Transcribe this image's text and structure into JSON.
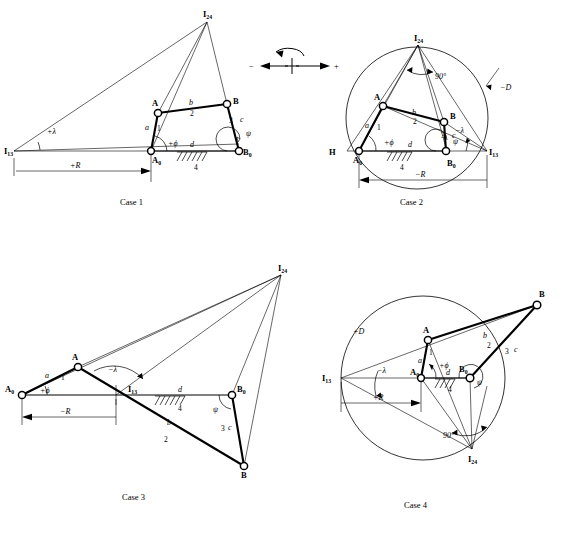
{
  "figure": {
    "sign_legend": {
      "minus_label": "−",
      "plus_center_label": "+",
      "plus_right_label": "+",
      "rotation_icon": "ccw-rotation-arrow"
    }
  },
  "symbols": {
    "A": "A",
    "B": "B",
    "A0": "A",
    "A0_sub": "0",
    "B0": "B",
    "B0_sub": "0",
    "H": "H",
    "I13": "I",
    "I13_sub": "13",
    "I24": "I",
    "I24_sub": "24",
    "link_a": "a",
    "link_b": "b",
    "link_c": "c",
    "link_d": "d",
    "num1": "1",
    "num2": "2",
    "num3": "3",
    "num4": "4",
    "phi_plus": "+ϕ",
    "psi": "ψ",
    "lambda_plus": "+λ",
    "lambda_minus": "−λ",
    "R_plus": "+R",
    "R_minus": "−R",
    "D_plus": "+D",
    "D_minus": "−D",
    "angle90": "90°"
  },
  "cases": [
    {
      "id": "case1",
      "caption": "Case 1",
      "has_circle": false,
      "labels": {
        "lambda": "+λ",
        "R": "+R",
        "phi": "+ϕ",
        "psi": "ψ"
      }
    },
    {
      "id": "case2",
      "caption": "Case 2",
      "has_circle": true,
      "labels": {
        "lambda": "−λ",
        "R": "−R",
        "D": "−D",
        "phi": "+ϕ",
        "psi": "ψ",
        "angle": "90°",
        "H": "H"
      }
    },
    {
      "id": "case3",
      "caption": "Case 3",
      "has_circle": false,
      "labels": {
        "lambda": "−λ",
        "R": "−R",
        "phi": "+ϕ",
        "psi": "ψ"
      }
    },
    {
      "id": "case4",
      "caption": "Case 4",
      "has_circle": true,
      "labels": {
        "lambda": "−λ",
        "R": "+R",
        "D": "+D",
        "phi": "+ϕ",
        "psi": "ψ",
        "angle": "90°"
      }
    }
  ]
}
